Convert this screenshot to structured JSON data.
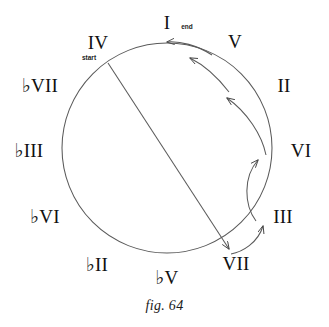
{
  "figure": {
    "caption": "fig. 64",
    "circle": {
      "center_x": 167,
      "center_y": 148,
      "radius": 105,
      "stroke_color": "#555555"
    },
    "nodes": [
      {
        "id": "I",
        "label": "I",
        "role": "end",
        "x": 167,
        "y": 22,
        "angle_deg": -90
      },
      {
        "id": "V",
        "label": "V",
        "role": "",
        "x": 235,
        "y": 41,
        "angle_deg": -60
      },
      {
        "id": "II",
        "label": "II",
        "role": "",
        "x": 284,
        "y": 85,
        "angle_deg": -30
      },
      {
        "id": "VI",
        "label": "VI",
        "role": "",
        "x": 301,
        "y": 150,
        "angle_deg": 0
      },
      {
        "id": "III",
        "label": "III",
        "role": "",
        "x": 283,
        "y": 216,
        "angle_deg": 30
      },
      {
        "id": "VII",
        "label": "VII",
        "role": "",
        "x": 236,
        "y": 263,
        "angle_deg": 60
      },
      {
        "id": "bV",
        "label": "♭V",
        "role": "",
        "x": 167,
        "y": 277,
        "angle_deg": 90
      },
      {
        "id": "bII",
        "label": "♭II",
        "role": "",
        "x": 97,
        "y": 264,
        "angle_deg": 120
      },
      {
        "id": "bVI",
        "label": "♭VI",
        "role": "",
        "x": 45,
        "y": 216,
        "angle_deg": 150
      },
      {
        "id": "bIII",
        "label": "♭III",
        "role": "",
        "x": 29,
        "y": 150,
        "angle_deg": 180
      },
      {
        "id": "bVII",
        "label": "♭VII",
        "role": "",
        "x": 40,
        "y": 85,
        "angle_deg": 210
      },
      {
        "id": "IV",
        "label": "IV",
        "role": "start",
        "x": 98,
        "y": 42,
        "angle_deg": 240
      }
    ],
    "arrows": [
      {
        "from": "IV",
        "to": "VII",
        "kind": "straight",
        "label": ""
      },
      {
        "from": "VII",
        "to": "III",
        "kind": "curve",
        "label": ""
      },
      {
        "from": "III",
        "to": "VI",
        "kind": "curve",
        "label": ""
      },
      {
        "from": "VI",
        "to": "II",
        "kind": "curve",
        "label": ""
      },
      {
        "from": "II",
        "to": "V",
        "kind": "curve",
        "label": ""
      },
      {
        "from": "V",
        "to": "I",
        "kind": "curve",
        "label": ""
      }
    ],
    "roles": {
      "start_text": "start",
      "end_text": "end"
    }
  }
}
